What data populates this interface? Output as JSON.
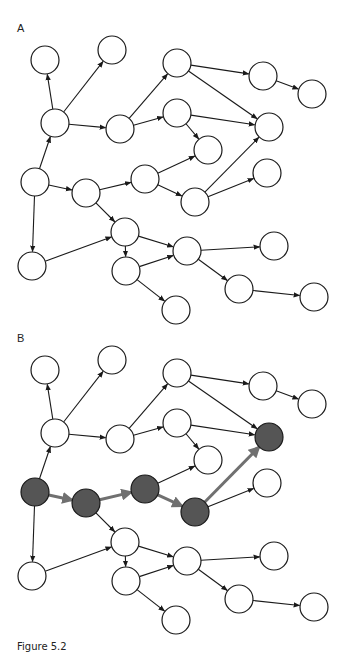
{
  "figure": {
    "caption": "Figure 5.2",
    "node_radius": 14,
    "colors": {
      "node_fill": "#ffffff",
      "node_stroke": "#1a1a1a",
      "highlight_fill": "#555555",
      "edge": "#1a1a1a",
      "highlight_edge": "#707070"
    },
    "nodes": [
      {
        "id": "n1",
        "x": 45,
        "y": 60
      },
      {
        "id": "n2",
        "x": 112,
        "y": 50
      },
      {
        "id": "n3",
        "x": 55,
        "y": 123
      },
      {
        "id": "n4",
        "x": 120,
        "y": 129
      },
      {
        "id": "n5",
        "x": 177,
        "y": 63
      },
      {
        "id": "n6",
        "x": 177,
        "y": 113
      },
      {
        "id": "n8",
        "x": 208,
        "y": 150
      },
      {
        "id": "n9",
        "x": 145,
        "y": 179
      },
      {
        "id": "n10",
        "x": 195,
        "y": 202
      },
      {
        "id": "n11",
        "x": 263,
        "y": 76
      },
      {
        "id": "n12",
        "x": 312,
        "y": 94
      },
      {
        "id": "n13",
        "x": 269,
        "y": 127
      },
      {
        "id": "n14",
        "x": 267,
        "y": 173
      },
      {
        "id": "n15",
        "x": 35,
        "y": 182
      },
      {
        "id": "n16",
        "x": 86,
        "y": 193
      },
      {
        "id": "n17",
        "x": 125,
        "y": 232
      },
      {
        "id": "n18",
        "x": 32,
        "y": 266
      },
      {
        "id": "n19",
        "x": 126,
        "y": 271
      },
      {
        "id": "n20",
        "x": 187,
        "y": 251
      },
      {
        "id": "n21",
        "x": 274,
        "y": 246
      },
      {
        "id": "n22",
        "x": 239,
        "y": 289
      },
      {
        "id": "n23",
        "x": 314,
        "y": 297
      },
      {
        "id": "n24",
        "x": 176,
        "y": 310
      }
    ],
    "edges": [
      [
        "n3",
        "n1"
      ],
      [
        "n3",
        "n2"
      ],
      [
        "n3",
        "n4"
      ],
      [
        "n15",
        "n3"
      ],
      [
        "n4",
        "n5"
      ],
      [
        "n4",
        "n6"
      ],
      [
        "n5",
        "n11"
      ],
      [
        "n5",
        "n13"
      ],
      [
        "n11",
        "n12"
      ],
      [
        "n6",
        "n13"
      ],
      [
        "n6",
        "n8"
      ],
      [
        "n9",
        "n8"
      ],
      [
        "n10",
        "n13"
      ],
      [
        "n10",
        "n14"
      ],
      [
        "n9",
        "n10"
      ],
      [
        "n16",
        "n9"
      ],
      [
        "n15",
        "n16"
      ],
      [
        "n15",
        "n18"
      ],
      [
        "n16",
        "n17"
      ],
      [
        "n18",
        "n17"
      ],
      [
        "n17",
        "n19"
      ],
      [
        "n17",
        "n20"
      ],
      [
        "n19",
        "n20"
      ],
      [
        "n19",
        "n24"
      ],
      [
        "n20",
        "n21"
      ],
      [
        "n20",
        "n22"
      ],
      [
        "n22",
        "n23"
      ]
    ],
    "panels": [
      {
        "label": "A",
        "offset_y": 0,
        "highlight_nodes": [],
        "highlight_edges": []
      },
      {
        "label": "B",
        "offset_y": 310,
        "highlight_nodes": [
          "n15",
          "n16",
          "n9",
          "n10",
          "n13"
        ],
        "highlight_edges": [
          [
            "n15",
            "n16"
          ],
          [
            "n16",
            "n9"
          ],
          [
            "n9",
            "n10"
          ],
          [
            "n10",
            "n13"
          ]
        ]
      }
    ]
  }
}
